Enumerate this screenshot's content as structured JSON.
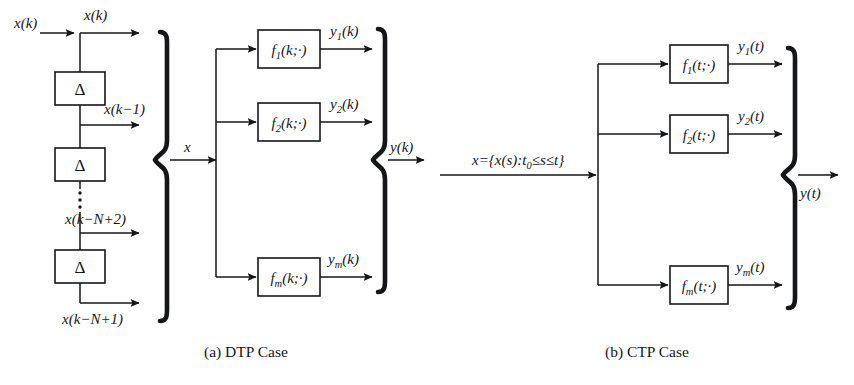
{
  "figure": {
    "background_color": "#ffffff",
    "ink_color": "#15161a",
    "captions": {
      "left": "(a) DTP Case",
      "right": "(b) CTP Case"
    }
  },
  "dtp": {
    "input_label": "x(k)",
    "tap_labels": [
      "x(k)",
      "x(k−1)",
      "x(k−N+2)",
      "x(k−N+1)"
    ],
    "delay_symbol": "Δ",
    "delay_count": 3,
    "vertical_ellipsis": "⋮",
    "bus_label": "x",
    "blocks": [
      {
        "name": "f",
        "sub": "1",
        "arg": "(k;·)",
        "out_name": "y",
        "out_sub": "1",
        "out_arg": "(k)"
      },
      {
        "name": "f",
        "sub": "2",
        "arg": "(k;·)",
        "out_name": "y",
        "out_sub": "2",
        "out_arg": "(k)"
      },
      {
        "name": "f",
        "sub": "m",
        "arg": "(k;·)",
        "out_name": "y",
        "out_sub": "m",
        "out_arg": "(k)"
      }
    ],
    "output_label": "y(k)"
  },
  "ctp": {
    "input_label": "x={x(s):t",
    "input_label_sub": "0",
    "input_label_tail": "≤s≤t}",
    "blocks": [
      {
        "name": "f",
        "sub": "1",
        "arg": "(t;·)",
        "out_name": "y",
        "out_sub": "1",
        "out_arg": "(t)"
      },
      {
        "name": "f",
        "sub": "2",
        "arg": "(t;·)",
        "out_name": "y",
        "out_sub": "2",
        "out_arg": "(t)"
      },
      {
        "name": "f",
        "sub": "m",
        "arg": "(t;·)",
        "out_name": "y",
        "out_sub": "m",
        "out_arg": "(t)"
      }
    ],
    "output_label": "y(t)"
  }
}
